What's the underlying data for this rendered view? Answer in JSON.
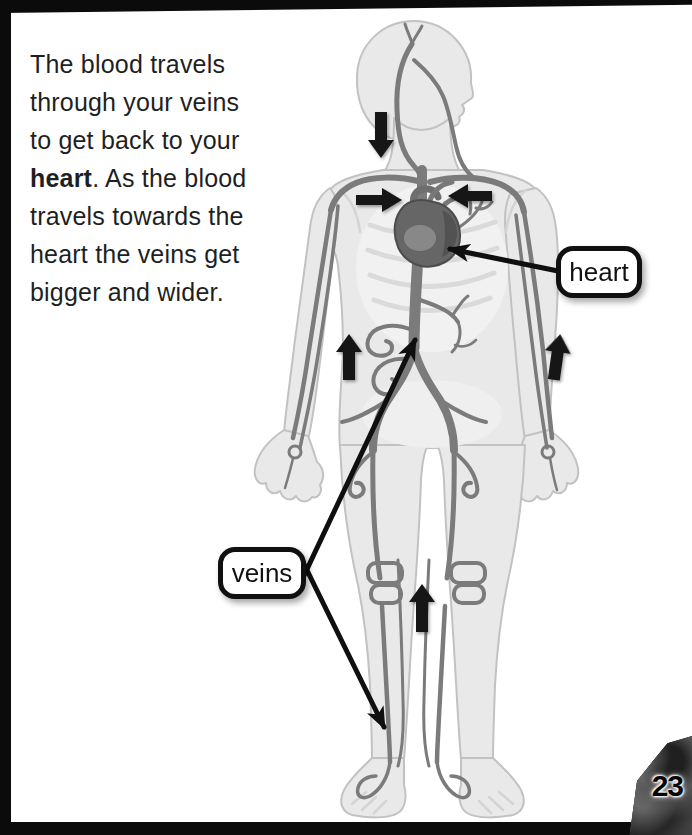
{
  "page": {
    "number": "23"
  },
  "paragraph": {
    "line1": "The blood travels",
    "line2": "through your veins",
    "line3": "to get back to your",
    "line4_bold": "heart",
    "line4_rest": ". As the blood",
    "line5": "travels towards the",
    "line6": "heart the veins get",
    "line7": "bigger and wider."
  },
  "labels": {
    "heart": "heart",
    "veins": "veins"
  },
  "colors": {
    "page_bg": "#ffffff",
    "edge_black": "#0b0b0b",
    "body_fill": "#e9e9e9",
    "body_outline": "#c2c2c2",
    "vein": "#7b7b7b",
    "vein_light": "#9a9a9a",
    "heart_fill": "#666666",
    "flow_arrow": "#141414",
    "label_border": "#101010",
    "label_bg": "#ffffff",
    "text": "#1f1f1f"
  }
}
